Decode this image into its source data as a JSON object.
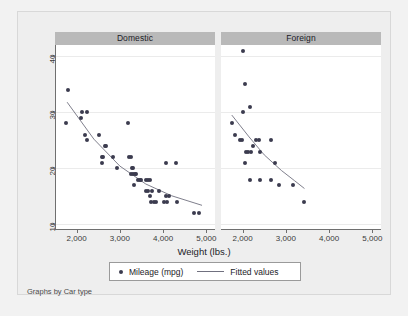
{
  "chart_data": {
    "type": "scatter",
    "title": "",
    "xlabel": "Weight (lbs.)",
    "ylabel": "",
    "note": "Graphs by Car type",
    "grid": true,
    "legend_position": "bottom",
    "xlim": [
      1500,
      5200
    ],
    "ylim": [
      9,
      42
    ],
    "xticks": [
      2000,
      3000,
      4000,
      5000
    ],
    "xtick_labels": [
      "2,000",
      "3,000",
      "4,000",
      "5,000"
    ],
    "yticks": [
      10,
      20,
      30,
      40
    ],
    "ytick_labels": [
      "10",
      "20",
      "30",
      "40"
    ],
    "legend": [
      {
        "label": "Mileage (mpg)",
        "marker": "circle",
        "color": "#3b3b4f"
      },
      {
        "label": "Fitted values",
        "marker": "line",
        "color": "#70707f"
      }
    ],
    "panels": [
      {
        "name": "Domestic",
        "points": [
          [
            1800,
            34
          ],
          [
            1760,
            28
          ],
          [
            2130,
            30
          ],
          [
            2230,
            30
          ],
          [
            2110,
            29
          ],
          [
            2230,
            25
          ],
          [
            2200,
            26
          ],
          [
            2520,
            26
          ],
          [
            2650,
            24
          ],
          [
            2690,
            24
          ],
          [
            2580,
            22
          ],
          [
            2600,
            22
          ],
          [
            2590,
            21
          ],
          [
            2830,
            22
          ],
          [
            2930,
            20
          ],
          [
            3180,
            28
          ],
          [
            3250,
            22
          ],
          [
            3200,
            22
          ],
          [
            3280,
            20
          ],
          [
            3300,
            20
          ],
          [
            3260,
            19
          ],
          [
            3300,
            19
          ],
          [
            3350,
            19
          ],
          [
            3380,
            19
          ],
          [
            3420,
            18
          ],
          [
            3470,
            18
          ],
          [
            3500,
            18
          ],
          [
            3600,
            18
          ],
          [
            3650,
            18
          ],
          [
            3700,
            18
          ],
          [
            3330,
            17
          ],
          [
            3600,
            16
          ],
          [
            3650,
            16
          ],
          [
            3750,
            16
          ],
          [
            3900,
            16
          ],
          [
            3700,
            15
          ],
          [
            4060,
            15
          ],
          [
            4130,
            15
          ],
          [
            3720,
            14
          ],
          [
            3790,
            14
          ],
          [
            3830,
            14
          ],
          [
            4030,
            14
          ],
          [
            4100,
            14
          ],
          [
            4330,
            14
          ],
          [
            4060,
            21
          ],
          [
            4290,
            21
          ],
          [
            4720,
            12
          ],
          [
            4840,
            12
          ]
        ],
        "fit": [
          [
            1780,
            31.8
          ],
          [
            2400,
            25.2
          ],
          [
            3000,
            20.4
          ],
          [
            3600,
            17.2
          ],
          [
            4200,
            15.1
          ],
          [
            4900,
            13.4
          ]
        ]
      },
      {
        "name": "Foreign",
        "points": [
          [
            2020,
            41
          ],
          [
            2050,
            35
          ],
          [
            2160,
            31
          ],
          [
            2010,
            30
          ],
          [
            1760,
            28
          ],
          [
            1830,
            26
          ],
          [
            1930,
            25
          ],
          [
            1980,
            25
          ],
          [
            2300,
            25
          ],
          [
            2380,
            25
          ],
          [
            2650,
            25
          ],
          [
            2070,
            23
          ],
          [
            2130,
            23
          ],
          [
            2190,
            23
          ],
          [
            2240,
            24
          ],
          [
            2410,
            23
          ],
          [
            2050,
            21
          ],
          [
            2160,
            18
          ],
          [
            2410,
            18
          ],
          [
            2650,
            18
          ],
          [
            2750,
            21
          ],
          [
            2830,
            17
          ],
          [
            3170,
            17
          ],
          [
            3420,
            14
          ]
        ],
        "fit": [
          [
            1750,
            29.5
          ],
          [
            2150,
            25.6
          ],
          [
            2500,
            22.4
          ],
          [
            2900,
            19.6
          ],
          [
            3200,
            17.8
          ],
          [
            3430,
            16.4
          ]
        ]
      }
    ]
  },
  "legend_box": {
    "mileage_label": "Mileage (mpg)",
    "fitted_label": "Fitted values"
  },
  "axis": {
    "x_title": "Weight (lbs.)"
  },
  "footnote": "Graphs by Car type"
}
